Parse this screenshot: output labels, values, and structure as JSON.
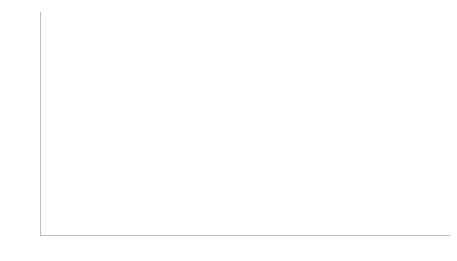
{
  "chart_data": {
    "type": "bar",
    "title": "",
    "xlabel": "",
    "ylabel": "",
    "ylim": [
      0,
      1.2
    ],
    "yticks": [
      "0,0%",
      "0,2%",
      "0,4%",
      "0,6%",
      "0,8%",
      "1,0%",
      "1,2%"
    ],
    "grid": false,
    "categories": [
      "1997",
      "1998",
      "1999",
      "2000",
      "2001",
      "2002",
      "2003",
      "2004",
      "2005",
      "2006",
      "2007",
      "2008",
      "2009",
      "2010"
    ],
    "values": [
      0.83,
      0.8,
      0.69,
      0.98,
      0.86,
      0.56,
      0.46,
      0.83,
      0.8,
      0.69,
      0.98,
      0.86,
      0.56,
      0.46
    ],
    "value_labels": [
      "0,83%",
      "0,80%",
      "0,69%",
      "0,98%",
      "0,86%",
      "0,56%",
      "0,46%",
      "0,83%",
      "0,80%",
      "0,69%",
      "0,98%",
      "0,86%",
      "0,56%",
      "0,46%"
    ],
    "bar_color": "#b3b3b3",
    "annotations": [
      {
        "text": "PAF",
        "points_to": "1997"
      },
      {
        "text": "LRF",
        "points_to": "2000"
      }
    ]
  }
}
